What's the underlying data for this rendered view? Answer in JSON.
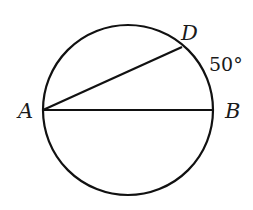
{
  "diagram": {
    "type": "circle-geometry",
    "circle": {
      "cx": 128,
      "cy": 110,
      "r": 85,
      "stroke": "#111111"
    },
    "points": [
      {
        "id": "A",
        "label": "A",
        "x": 43,
        "y": 110
      },
      {
        "id": "B",
        "label": "B",
        "x": 213,
        "y": 110
      },
      {
        "id": "D",
        "label": "D",
        "x": 182,
        "y": 47
      }
    ],
    "segments": [
      {
        "from": "A",
        "to": "B",
        "name": "diameter-AB"
      },
      {
        "from": "A",
        "to": "D",
        "name": "chord-AD"
      }
    ],
    "annotations": [
      {
        "text": "50°",
        "describes": "arc DB"
      }
    ],
    "labels": {
      "A": "A",
      "B": "B",
      "D": "D",
      "arc_DB": "50°"
    }
  }
}
